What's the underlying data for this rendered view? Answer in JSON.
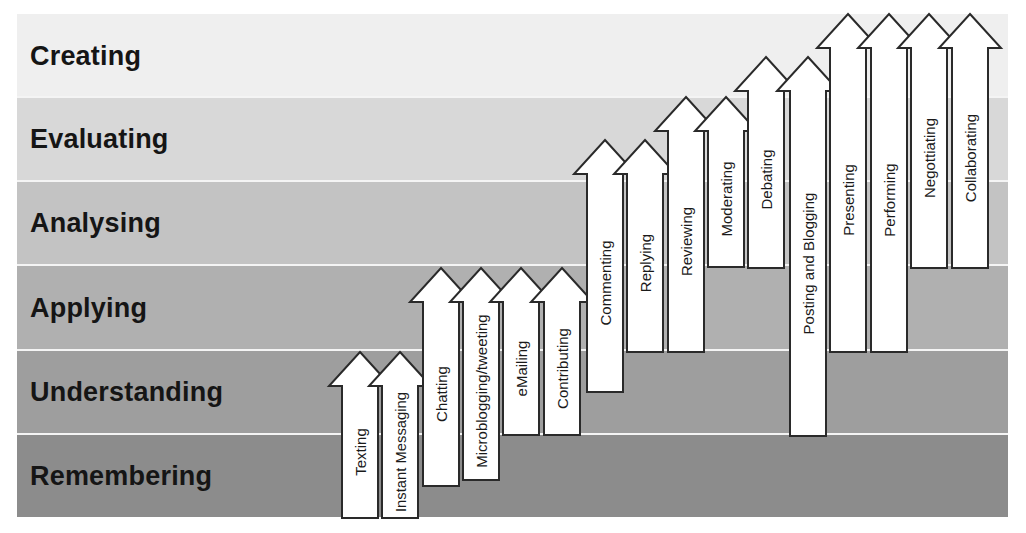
{
  "diagram": {
    "type": "taxonomy-staircase",
    "levels": [
      {
        "label": "Creating",
        "color": "#efefef",
        "top": 14,
        "height": 83
      },
      {
        "label": "Evaluating",
        "color": "#d8d8d8",
        "top": 98,
        "height": 82
      },
      {
        "label": "Analysing",
        "color": "#c3c3c3",
        "top": 182,
        "height": 82
      },
      {
        "label": "Applying",
        "color": "#b0b0b0",
        "top": 266,
        "height": 83
      },
      {
        "label": "Understanding",
        "color": "#9e9e9e",
        "top": 351,
        "height": 82
      },
      {
        "label": "Remembering",
        "color": "#8c8c8c",
        "top": 435,
        "height": 82
      }
    ],
    "arrows": [
      {
        "label": "Texting",
        "cx": 360,
        "tip": 352,
        "bottom": 518
      },
      {
        "label": "Instant Messaging",
        "cx": 400,
        "tip": 352,
        "bottom": 518
      },
      {
        "label": "Chatting",
        "cx": 441,
        "tip": 268,
        "bottom": 486
      },
      {
        "label": "Microblogging/tweeting",
        "cx": 481,
        "tip": 268,
        "bottom": 480
      },
      {
        "label": "eMailing",
        "cx": 521,
        "tip": 268,
        "bottom": 435
      },
      {
        "label": "Contributing",
        "cx": 562,
        "tip": 268,
        "bottom": 435
      },
      {
        "label": "Commenting",
        "cx": 605,
        "tip": 140,
        "bottom": 392
      },
      {
        "label": "Replying",
        "cx": 645,
        "tip": 140,
        "bottom": 352
      },
      {
        "label": "Reviewing",
        "cx": 686,
        "tip": 97,
        "bottom": 352
      },
      {
        "label": "Moderating",
        "cx": 726,
        "tip": 97,
        "bottom": 267
      },
      {
        "label": "Debating",
        "cx": 766,
        "tip": 57,
        "bottom": 268
      },
      {
        "label": "Posting and Blogging",
        "cx": 808,
        "tip": 57,
        "bottom": 436
      },
      {
        "label": "Presenting",
        "cx": 848,
        "tip": 14,
        "bottom": 352
      },
      {
        "label": "Performing",
        "cx": 889,
        "tip": 14,
        "bottom": 352
      },
      {
        "label": "Negottiating",
        "cx": 929,
        "tip": 14,
        "bottom": 268
      },
      {
        "label": "Collaborating",
        "cx": 970,
        "tip": 14,
        "bottom": 268
      }
    ],
    "arrow_fill": "#ffffff",
    "arrow_stroke": "#2a2a2a",
    "separator_color": "#f4f4f4"
  }
}
